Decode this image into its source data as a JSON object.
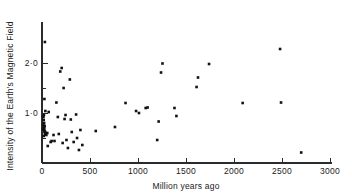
{
  "chart_data": {
    "type": "scatter",
    "title": "",
    "xlabel": "Million years ago",
    "ylabel": "Intensity of the Earth's Magnetic Field",
    "xlim": [
      0,
      3000
    ],
    "ylim": [
      0,
      2.55
    ],
    "grid": false,
    "legend": null,
    "xticks": [
      0,
      500,
      1000,
      1500,
      2000,
      2500,
      3000
    ],
    "xtick_labels": [
      "0",
      "500",
      "1000",
      "1500",
      "2000",
      "2500",
      "3000"
    ],
    "yticks": [
      1.0,
      2.0
    ],
    "ytick_labels": [
      "1·0",
      "2·0"
    ],
    "y_minor_ticks": [
      0.5,
      1.5
    ],
    "marker": "square",
    "marker_color": "#111111",
    "marker_size": 2.6,
    "points": [
      [
        30,
        2.42
      ],
      [
        25,
        1.28
      ],
      [
        35,
        1.04
      ],
      [
        20,
        0.96
      ],
      [
        15,
        0.92
      ],
      [
        18,
        0.86
      ],
      [
        22,
        0.8
      ],
      [
        14,
        0.76
      ],
      [
        28,
        0.74
      ],
      [
        16,
        0.72
      ],
      [
        24,
        0.7
      ],
      [
        12,
        0.68
      ],
      [
        20,
        0.66
      ],
      [
        30,
        0.64
      ],
      [
        26,
        0.62
      ],
      [
        40,
        0.6
      ],
      [
        32,
        0.58
      ],
      [
        45,
        0.56
      ],
      [
        18,
        0.54
      ],
      [
        55,
        0.6
      ],
      [
        60,
        0.34
      ],
      [
        70,
        1.02
      ],
      [
        90,
        0.42
      ],
      [
        100,
        0.44
      ],
      [
        120,
        0.56
      ],
      [
        130,
        0.44
      ],
      [
        150,
        1.21
      ],
      [
        165,
        0.92
      ],
      [
        175,
        0.58
      ],
      [
        190,
        1.83
      ],
      [
        205,
        1.9
      ],
      [
        215,
        0.4
      ],
      [
        225,
        1.5
      ],
      [
        235,
        0.88
      ],
      [
        245,
        0.96
      ],
      [
        255,
        0.46
      ],
      [
        270,
        0.3
      ],
      [
        290,
        1.67
      ],
      [
        300,
        0.87
      ],
      [
        310,
        0.62
      ],
      [
        330,
        0.42
      ],
      [
        355,
        0.97
      ],
      [
        365,
        0.5
      ],
      [
        385,
        0.26
      ],
      [
        400,
        0.66
      ],
      [
        420,
        0.36
      ],
      [
        560,
        0.64
      ],
      [
        760,
        0.72
      ],
      [
        870,
        1.2
      ],
      [
        980,
        1.04
      ],
      [
        1010,
        1.0
      ],
      [
        1080,
        1.1
      ],
      [
        1100,
        1.11
      ],
      [
        1200,
        0.46
      ],
      [
        1215,
        0.83
      ],
      [
        1240,
        1.81
      ],
      [
        1255,
        1.99
      ],
      [
        1380,
        1.1
      ],
      [
        1400,
        0.94
      ],
      [
        1610,
        1.52
      ],
      [
        1625,
        1.71
      ],
      [
        1740,
        1.98
      ],
      [
        2090,
        1.2
      ],
      [
        2480,
        2.28
      ],
      [
        2490,
        1.21
      ],
      [
        2700,
        0.21
      ]
    ]
  },
  "figure": {
    "axis_color": "#2b2b2b",
    "background": "#ffffff"
  }
}
